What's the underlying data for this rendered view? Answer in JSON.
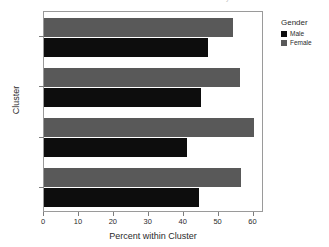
{
  "title": "Percent within Cluster by Gender",
  "legend": {
    "title": "Gender",
    "entries": [
      {
        "label": "Male",
        "color": "#0d0d0d"
      },
      {
        "label": "Female",
        "color": "#595959"
      }
    ]
  },
  "axes": {
    "x_title": "Percent within Cluster",
    "y_title": "Cluster",
    "x_ticks": [
      "0",
      "10",
      "20",
      "30",
      "40",
      "50",
      "60"
    ],
    "y_ticks": [
      "1",
      "2",
      "3",
      "Overall"
    ]
  },
  "chart_data": {
    "type": "bar",
    "orientation": "horizontal",
    "title": "Percent within Cluster by Gender",
    "xlabel": "Percent within Cluster",
    "ylabel": "Cluster",
    "xlim": [
      0,
      63
    ],
    "grid": false,
    "legend_position": "right",
    "legend_title": "Gender",
    "categories": [
      "1",
      "2",
      "3",
      "Overall"
    ],
    "series": [
      {
        "name": "Male",
        "color": "#0d0d0d",
        "values": [
          47.0,
          45.0,
          41.0,
          44.5
        ]
      },
      {
        "name": "Female",
        "color": "#595959",
        "values": [
          54.0,
          56.0,
          60.0,
          56.5
        ]
      }
    ]
  }
}
